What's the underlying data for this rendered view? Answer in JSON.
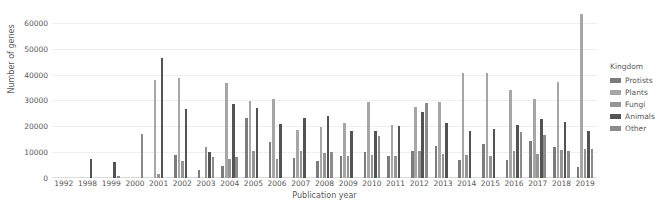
{
  "title": "",
  "legend": {
    "title": "Kingdom",
    "position": "right",
    "items": [
      {
        "label": "Protists",
        "color": "#7c7c7c"
      },
      {
        "label": "Plants",
        "color": "#a6a6a6"
      },
      {
        "label": "Fungi",
        "color": "#959595"
      },
      {
        "label": "Animals",
        "color": "#535353"
      },
      {
        "label": "Other",
        "color": "#8b8b8b"
      }
    ]
  },
  "axes": {
    "xlabel": "Publication year",
    "ylabel": "Number of genes",
    "yticks": [
      0,
      10000,
      20000,
      30000,
      40000,
      50000,
      60000
    ],
    "yticklabels": [
      "0",
      "10000",
      "20000",
      "30000",
      "40000",
      "50000",
      "60000"
    ],
    "ylim": [
      0,
      65000
    ],
    "grid": "horizontal"
  },
  "chart_data": {
    "type": "bar",
    "title": "",
    "xlabel": "Publication year",
    "ylabel": "Number of genes",
    "ylim": [
      0,
      65000
    ],
    "grid": true,
    "legend_title": "Kingdom",
    "legend_position": "right",
    "categories": [
      "1992",
      "1998",
      "1999",
      "2000",
      "2001",
      "2002",
      "2003",
      "2004",
      "2005",
      "2006",
      "2007",
      "2008",
      "2009",
      "2010",
      "2011",
      "2012",
      "2013",
      "2014",
      "2015",
      "2016",
      "2017",
      "2018",
      "2019"
    ],
    "series": [
      {
        "name": "Protists",
        "color": "#7c7c7c",
        "values": [
          0,
          0,
          0,
          0,
          0,
          8900,
          3200,
          4800,
          23300,
          13900,
          7900,
          6400,
          8400,
          10200,
          8400,
          10300,
          12500,
          7100,
          13200,
          6900,
          14300,
          12100,
          4300
        ]
      },
      {
        "name": "Plants",
        "color": "#a6a6a6",
        "values": [
          0,
          0,
          0,
          0,
          37900,
          38700,
          0,
          36600,
          29800,
          30400,
          18700,
          19600,
          21300,
          29300,
          20400,
          27400,
          29300,
          40500,
          40500,
          34200,
          30600,
          37200,
          63500
        ]
      },
      {
        "name": "Fungi",
        "color": "#959595",
        "values": [
          0,
          0,
          0,
          0,
          1700,
          6700,
          11900,
          7200,
          10300,
          7500,
          10300,
          9600,
          8400,
          9000,
          8400,
          10400,
          9100,
          8800,
          8500,
          10300,
          9200,
          10800,
          11200
        ]
      },
      {
        "name": "Animals",
        "color": "#535353",
        "values": [
          0,
          7500,
          6300,
          0,
          46500,
          26600,
          9900,
          28700,
          27200,
          20800,
          23400,
          23900,
          18200,
          18200,
          20000,
          25600,
          21200,
          18200,
          18900,
          20400,
          22800,
          21600,
          18100
        ]
      },
      {
        "name": "Other",
        "color": "#8b8b8b",
        "values": [
          0,
          0,
          600,
          16900,
          0,
          0,
          8300,
          8200,
          0,
          0,
          0,
          10000,
          0,
          16400,
          0,
          29000,
          0,
          0,
          0,
          17700,
          16500,
          10300,
          11300
        ]
      }
    ]
  }
}
